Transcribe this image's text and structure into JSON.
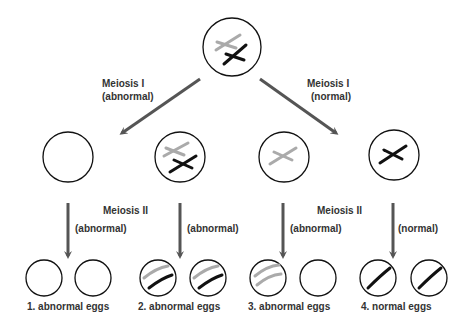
{
  "colors": {
    "arrow": "#555555",
    "outline": "#111111",
    "maternal": "#aaaaaa",
    "paternal": "#111111"
  },
  "labels": {
    "meiosis1_left": [
      "Meiosis I",
      "(abnormal)"
    ],
    "meiosis1_right": [
      "Meiosis I",
      "(normal)"
    ],
    "meiosis2_left": "Meiosis II",
    "meiosis2_right": "Meiosis II",
    "branch_1": "(abnormal)",
    "branch_2": "(abnormal)",
    "branch_3": "(abnormal)",
    "branch_4": "(normal)"
  },
  "outcomes": [
    {
      "label": "1.  abnormal eggs"
    },
    {
      "label": "2.  abnormal eggs"
    },
    {
      "label": "3.  abnormal eggs"
    },
    {
      "label": "4.  normal eggs"
    }
  ]
}
